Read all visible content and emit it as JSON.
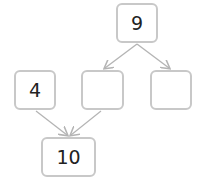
{
  "diagram": {
    "type": "number-bond",
    "nodes": [
      {
        "id": "top",
        "value": "9"
      },
      {
        "id": "left",
        "value": "4"
      },
      {
        "id": "middle",
        "value": ""
      },
      {
        "id": "right",
        "value": ""
      },
      {
        "id": "bottom",
        "value": "10"
      }
    ],
    "edges": [
      {
        "from": "top",
        "to": "middle"
      },
      {
        "from": "top",
        "to": "right"
      },
      {
        "from": "left",
        "to": "bottom"
      },
      {
        "from": "middle",
        "to": "bottom"
      }
    ],
    "colors": {
      "border": "#c8c8c8",
      "arrow": "#b4b4b4",
      "text": "#222222"
    }
  }
}
